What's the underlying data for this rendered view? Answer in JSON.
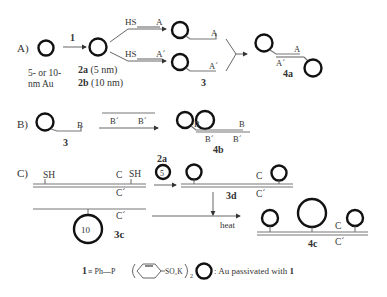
{
  "panels": {
    "A": {
      "label": "A)",
      "start_caption_line1": "5- or 10-",
      "start_caption_line2": "nm Au",
      "reagent": "1",
      "product_2a": "2a",
      "product_2a_size": " (5 nm)",
      "product_2b": "2b",
      "product_2b_size": " (10 nm)",
      "thiol_top": "HS",
      "seq_top": "A",
      "thiol_bottom": "HS",
      "seq_bottom": "A´",
      "conjugate_label": "3",
      "dimer_seq_top": "A",
      "dimer_seq_bottom": "A´",
      "dimer_label": "4a"
    },
    "B": {
      "label": "B)",
      "conjugate_label": "3",
      "seq": "B",
      "template_seq_1": "B´",
      "template_seq_2": "B´",
      "product_seq_1": "B",
      "product_seq_2": "B",
      "product_comp_1": "B´",
      "product_comp_2": "B´",
      "product_label": "4b"
    },
    "C": {
      "label": "C)",
      "thiol_1": "SH",
      "seq_c": "C",
      "thiol_2": "SH",
      "seq_c_prime_top": "C´",
      "seq_c_prime_bottom": "C´",
      "particle_10_label": "10",
      "conjugate_label": "3c",
      "reagent_label": "2a",
      "particle_5_label": "5",
      "intermediate_label": "3d",
      "intermediate_c": "C",
      "intermediate_c_prime": "C´",
      "condition": "heat",
      "final_c": "C",
      "final_c_prime": "C´",
      "final_label": "4c"
    }
  },
  "legend": {
    "compound_number": "1",
    "definition_prefix": " ≡ Ph—P",
    "sulfonate": "SO₃K",
    "subscript": "2",
    "circle_meaning": ": Au passivated with ",
    "circle_meaning_bold": "1"
  }
}
